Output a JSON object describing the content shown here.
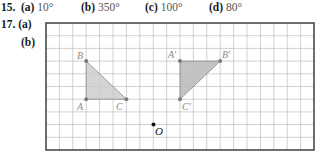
{
  "problem15": {
    "number": "15.",
    "parts": [
      {
        "label": "(a)",
        "answer": "10°"
      },
      {
        "label": "(b)",
        "answer": "350°"
      },
      {
        "label": "(c)",
        "answer": "100°"
      },
      {
        "label": "(d)",
        "answer": "80°"
      }
    ]
  },
  "problem17": {
    "number": "17.",
    "part_a": "(a)",
    "part_b": "(b)"
  },
  "figure": {
    "grid": {
      "cols": 20,
      "rows": 10
    },
    "original_triangle": {
      "A": "A",
      "B": "B",
      "C": "C"
    },
    "image_triangle": {
      "A": "A′",
      "B": "B′",
      "C": "C′"
    },
    "center": "O",
    "colors": {
      "fill": "#c9c9c9",
      "points": "#7a7a7a",
      "grid": "#bdbdbd",
      "border": "#333333"
    }
  }
}
